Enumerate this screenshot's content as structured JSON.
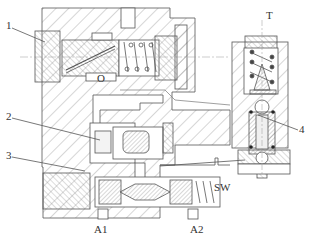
{
  "figure": {
    "type": "hydraulic-valve-cross-section",
    "colors": {
      "line": "#555555",
      "hatch": "#8a8a8a",
      "background": "#ffffff",
      "seal": "#222222"
    },
    "labels": {
      "part1": "1",
      "part2": "2",
      "part3": "3",
      "part4": "4",
      "port_o": "O",
      "port_t": "T",
      "port_sw": "SW",
      "port_a1": "A1",
      "port_a2": "A2"
    }
  }
}
